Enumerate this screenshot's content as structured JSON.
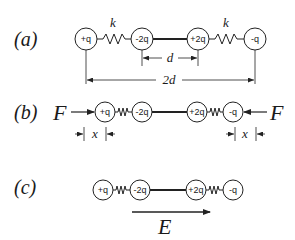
{
  "figure": {
    "parts": [
      {
        "label": "(a)",
        "charges": [
          "+q",
          "-2q",
          "+2q",
          "-q"
        ],
        "spring_labels": [
          "k",
          "k"
        ],
        "dimension_inner": "d",
        "dimension_outer": "2d"
      },
      {
        "label": "(b)",
        "charges": [
          "+q",
          "-2q",
          "+2q",
          "-q"
        ],
        "force_left": "F",
        "force_right": "F",
        "displacement_left": "x",
        "displacement_right": "x"
      },
      {
        "label": "(c)",
        "charges": [
          "+q",
          "-2q",
          "+2q",
          "-q"
        ],
        "field_label": "E"
      }
    ]
  }
}
